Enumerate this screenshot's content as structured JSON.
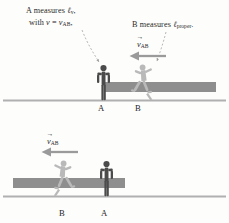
{
  "figure": {
    "background_color": "#fdfdfc"
  },
  "colors": {
    "standing_figure": "#4b4b4b",
    "running_figure": "#b9b9b9",
    "rod_bar": "#8e8e8e",
    "ground_line": "#b0b0b0",
    "arrow": "#9a9a9a",
    "leader_line": "#9a9a9a",
    "text": "#2b2b2b"
  },
  "top_panel": {
    "caption_a": {
      "line1_prefix": "A measures ",
      "line1_symbol": "ℓ",
      "line1_subscript": "v",
      "line1_suffix": ",",
      "line2_prefix": "with ",
      "line2_v": "v",
      "line2_equals": " = ",
      "line2_v2": "v",
      "line2_subscript": "AB",
      "line2_suffix": ","
    },
    "caption_b": {
      "prefix": "B measures ",
      "symbol": "ℓ",
      "subscript": "proper",
      "suffix": "."
    },
    "velocity_label": {
      "symbol": "v",
      "subscript": "AB",
      "accent": "vector-arrow"
    },
    "arrow_direction": "left",
    "labels": {
      "left_person": "A",
      "right_person": "B"
    },
    "left_person_state": "standing",
    "right_person_state": "running"
  },
  "bottom_panel": {
    "velocity_label": {
      "symbol": "v",
      "subscript": "AB",
      "accent": "vector-arrow"
    },
    "arrow_direction": "left",
    "labels": {
      "left_person": "B",
      "right_person": "A"
    },
    "left_person_state": "running",
    "right_person_state": "standing"
  }
}
